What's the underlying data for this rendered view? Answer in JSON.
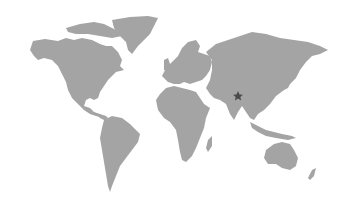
{
  "map": {
    "type": "world-map",
    "projection": "miller-like",
    "land_color": "#a4a4a4",
    "background_color": "#ffffff",
    "marker_color": "#4a4a4a"
  },
  "markers": [
    {
      "icon": "star-icon",
      "region": "South/East Asia (Tibet/China border)",
      "x": 238,
      "y": 96
    }
  ]
}
